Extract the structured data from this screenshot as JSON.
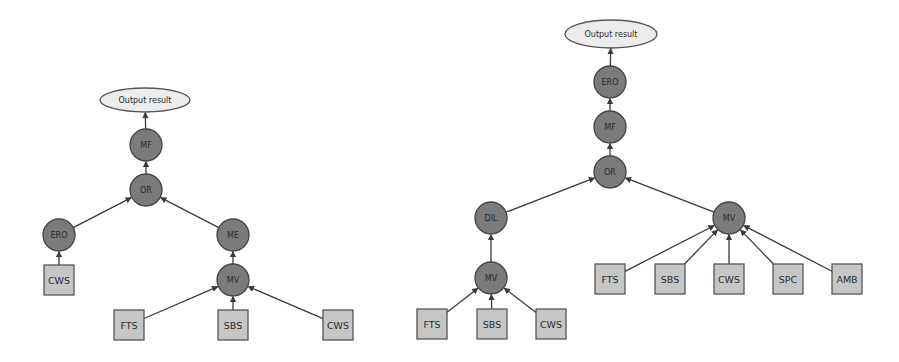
{
  "diagrams": [
    {
      "id": "left",
      "output": {
        "label": "Output result",
        "cx": 145,
        "cy": 100,
        "rx": 45,
        "ry": 12
      },
      "nodes": [
        {
          "id": "MF",
          "label": "MF",
          "shape": "circle",
          "cx": 146,
          "cy": 145
        },
        {
          "id": "OR",
          "label": "OR",
          "shape": "circle",
          "cx": 146,
          "cy": 190
        },
        {
          "id": "ERO",
          "label": "ERO",
          "shape": "circle",
          "cx": 59,
          "cy": 235
        },
        {
          "id": "ME",
          "label": "ME",
          "shape": "circle",
          "cx": 233,
          "cy": 235
        },
        {
          "id": "MV",
          "label": "MV",
          "shape": "circle",
          "cx": 233,
          "cy": 280
        },
        {
          "id": "CWS1",
          "label": "CWS",
          "shape": "box",
          "cx": 59,
          "cy": 280
        },
        {
          "id": "FTS",
          "label": "FTS",
          "shape": "box",
          "cx": 129,
          "cy": 325
        },
        {
          "id": "SBS",
          "label": "SBS",
          "shape": "box",
          "cx": 233,
          "cy": 325
        },
        {
          "id": "CWS2",
          "label": "CWS",
          "shape": "box",
          "cx": 338,
          "cy": 325
        }
      ],
      "edges": [
        [
          "MF",
          "OUT"
        ],
        [
          "OR",
          "MF"
        ],
        [
          "ERO",
          "OR"
        ],
        [
          "ME",
          "OR"
        ],
        [
          "CWS1",
          "ERO"
        ],
        [
          "MV",
          "ME"
        ],
        [
          "FTS",
          "MV"
        ],
        [
          "SBS",
          "MV"
        ],
        [
          "CWS2",
          "MV"
        ]
      ]
    },
    {
      "id": "right",
      "output": {
        "label": "Output result",
        "cx": 611,
        "cy": 34,
        "rx": 46,
        "ry": 14
      },
      "nodes": [
        {
          "id": "ERO",
          "label": "ERO",
          "shape": "circle",
          "cx": 610,
          "cy": 82
        },
        {
          "id": "MF",
          "label": "MF",
          "shape": "circle",
          "cx": 610,
          "cy": 127
        },
        {
          "id": "OR",
          "label": "OR",
          "shape": "circle",
          "cx": 610,
          "cy": 172
        },
        {
          "id": "DIL",
          "label": "DIL",
          "shape": "circle",
          "cx": 491,
          "cy": 218
        },
        {
          "id": "MVR",
          "label": "MV",
          "shape": "circle",
          "cx": 729,
          "cy": 218
        },
        {
          "id": "MVL",
          "label": "MV",
          "shape": "circle",
          "cx": 491,
          "cy": 278
        },
        {
          "id": "FTS1",
          "label": "FTS",
          "shape": "box",
          "cx": 432,
          "cy": 324
        },
        {
          "id": "SBS1",
          "label": "SBS",
          "shape": "box",
          "cx": 492,
          "cy": 324
        },
        {
          "id": "CWS1",
          "label": "CWS",
          "shape": "box",
          "cx": 551,
          "cy": 324
        },
        {
          "id": "FTS2",
          "label": "FTS",
          "shape": "box",
          "cx": 610,
          "cy": 279
        },
        {
          "id": "SBS2",
          "label": "SBS",
          "shape": "box",
          "cx": 670,
          "cy": 279
        },
        {
          "id": "CWS2",
          "label": "CWS",
          "shape": "box",
          "cx": 729,
          "cy": 279
        },
        {
          "id": "SPC",
          "label": "SPC",
          "shape": "box",
          "cx": 788,
          "cy": 279
        },
        {
          "id": "AMB",
          "label": "AMB",
          "shape": "box",
          "cx": 847,
          "cy": 279
        }
      ],
      "edges": [
        [
          "ERO",
          "OUT"
        ],
        [
          "MF",
          "ERO"
        ],
        [
          "OR",
          "MF"
        ],
        [
          "DIL",
          "OR"
        ],
        [
          "MVR",
          "OR"
        ],
        [
          "MVL",
          "DIL"
        ],
        [
          "FTS1",
          "MVL"
        ],
        [
          "SBS1",
          "MVL"
        ],
        [
          "CWS1",
          "MVL"
        ],
        [
          "FTS2",
          "MVR"
        ],
        [
          "SBS2",
          "MVR"
        ],
        [
          "CWS2",
          "MVR"
        ],
        [
          "SPC",
          "MVR"
        ],
        [
          "AMB",
          "MVR"
        ]
      ]
    }
  ],
  "style": {
    "circle_fill": "#7b7b7b",
    "box_fill": "#c6c6c6",
    "ellipse_fill": "#ececec",
    "edge_color": "#3a3a3a",
    "circle_radius": 16,
    "box_size": 30
  }
}
